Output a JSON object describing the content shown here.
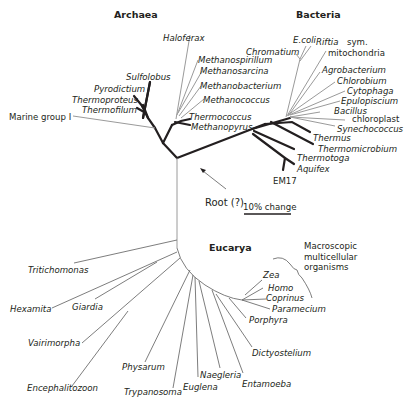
{
  "figure": {
    "domains": {
      "archaea": "Archaea",
      "bacteria": "Bacteria",
      "eucarya": "Eucarya"
    },
    "archaea_taxa": [
      "Haloferax",
      "Methanospirillum",
      "Methanosarcina",
      "Methanobacterium",
      "Methanococcus",
      "Thermococcus",
      "Methanopyrus",
      "Sulfolobus",
      "Pyrodictium",
      "Thermoproteus",
      "Thermofilum"
    ],
    "archaea_plain": [
      "Marine group I"
    ],
    "bacteria_taxa": [
      "E.coli",
      "Riftia",
      "Chromatium",
      "Agrobacterium",
      "Chlorobium",
      "Cytophaga",
      "Epulopiscium",
      "Bacillus",
      "Synechococcus",
      "Thermus",
      "Thermomicrobium",
      "Thermotoga",
      "Aquifex"
    ],
    "bacteria_plain": {
      "riftia_suffix": "sym.",
      "mitochondria": "mitochondria",
      "chloroplast": "chloroplast",
      "em17": "EM17"
    },
    "eucarya_taxa": [
      "Tritichomonas",
      "Hexamita",
      "Giardia",
      "Vairimorpha",
      "Encephalitozoon",
      "Physarum",
      "Trypanosoma",
      "Euglena",
      "Naegleria",
      "Entamoeba",
      "Dictyostelium",
      "Porphyra",
      "Paramecium",
      "Coprinus",
      "Homo",
      "Zea"
    ],
    "annotations": {
      "root": "Root (?)",
      "scale": "10% change",
      "macro_line1": "Macroscopic",
      "macro_line2": "multicellular",
      "macro_line3": "organisms"
    }
  }
}
